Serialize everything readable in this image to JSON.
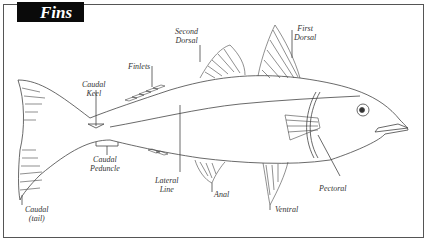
{
  "title": "Fins",
  "labels": {
    "second_dorsal": [
      "Second",
      "Dorsal"
    ],
    "first_dorsal": [
      "First",
      "Dorsal"
    ],
    "finlets": "Finlets",
    "caudal_keel": [
      "Caudal",
      "Keel"
    ],
    "caudal_peduncle": [
      "Caudal",
      "Peduncle"
    ],
    "caudal_tail": [
      "Caudal",
      "(tail)"
    ],
    "lateral_line": [
      "Lateral",
      "Line"
    ],
    "anal": "Anal",
    "ventral": "Ventral",
    "pectoral": "Pectoral"
  },
  "colors": {
    "line": "#444444",
    "title_bg": "#0a0a0a",
    "title_fg": "#ffffff"
  }
}
